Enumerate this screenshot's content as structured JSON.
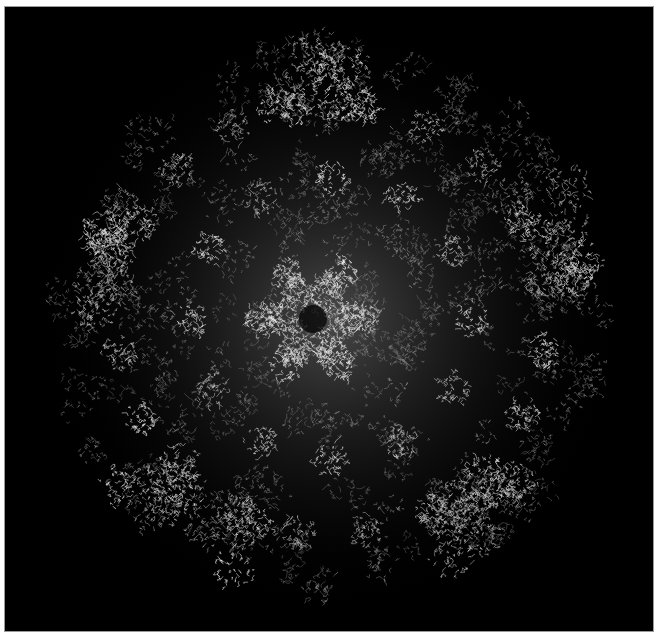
{
  "image": {
    "subject": "protein-capsid-structure",
    "background_color": "#000000",
    "frame_color": "#ffffff",
    "rendering_color": "#d8d8d8",
    "center": [
      330,
      318
    ],
    "radius": 290,
    "central_rosette": {
      "center": [
        312,
        318
      ],
      "radius": 62,
      "petals": 6
    }
  }
}
